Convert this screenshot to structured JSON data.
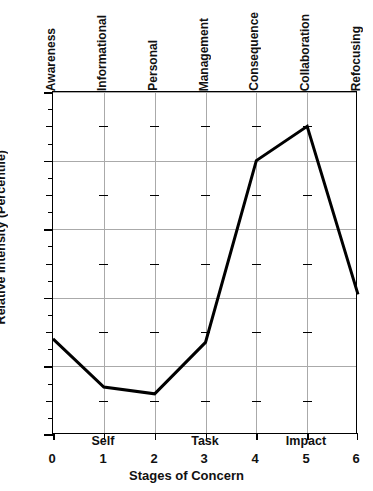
{
  "chart_data": {
    "type": "line",
    "title": "",
    "xlabel": "Stages of Concern",
    "ylabel": "Relative Intensity (Percentile)",
    "x": [
      0,
      1,
      2,
      3,
      4,
      5,
      6
    ],
    "values": [
      28,
      14,
      12,
      27,
      80,
      90,
      41
    ],
    "xlim": [
      0,
      6
    ],
    "ylim": [
      0,
      100
    ],
    "xticks": [
      "0",
      "1",
      "2",
      "3",
      "4",
      "5",
      "6"
    ],
    "yticks": [
      "0",
      "20",
      "40",
      "60",
      "80",
      "100"
    ],
    "y_major_step": 20,
    "y_minor_step": 5,
    "grid": "major x and y gridlines, light gray",
    "legend": "none",
    "line_color": "#000000",
    "line_width": 3,
    "stage_labels": [
      "Awareness",
      "Informational",
      "Personal",
      "Management",
      "Consequence",
      "Collaboration",
      "Refocusing"
    ],
    "group_labels": [
      {
        "label": "Self",
        "x": 1
      },
      {
        "label": "Task",
        "x": 3
      },
      {
        "label": "Impact",
        "x": 5
      }
    ]
  }
}
